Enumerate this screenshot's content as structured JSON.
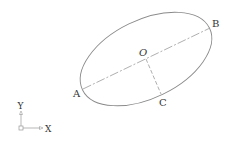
{
  "diagram": {
    "type": "ellipse-construction",
    "ellipse": {
      "cx": 146,
      "cy": 59,
      "rx": 70.6,
      "ry": 39,
      "rotation_deg": -26,
      "stroke": "#8a8a8a"
    },
    "points": {
      "A": {
        "label": "A",
        "x": 83,
        "y": 89
      },
      "B": {
        "label": "B",
        "x": 210,
        "y": 28
      },
      "O": {
        "label": "O",
        "x": 146,
        "y": 59
      },
      "C": {
        "label": "C",
        "x": 161,
        "y": 94
      }
    },
    "lines": [
      {
        "name": "major-axis",
        "from": "A",
        "to": "B",
        "style": "dash-dot"
      },
      {
        "name": "minor-semi-axis",
        "from": "O",
        "to": "C",
        "style": "dashed"
      }
    ],
    "ucs": {
      "x_label": "X",
      "y_label": "Y"
    }
  }
}
